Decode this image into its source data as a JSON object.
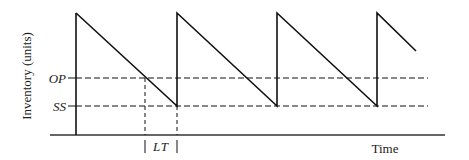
{
  "diagram": {
    "y_axis_label": "Inventory (units)",
    "x_axis_label": "Time",
    "levels": [
      {
        "name": "order-point",
        "label": "OP"
      },
      {
        "name": "safety-stock",
        "label": "SS"
      }
    ],
    "lead_time_label": "LT",
    "colors": {
      "line": "#111111",
      "background": "#ffffff"
    }
  }
}
